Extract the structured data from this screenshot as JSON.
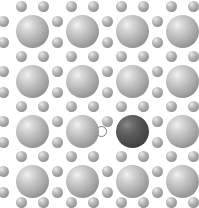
{
  "figure": {
    "width": 199,
    "height": 208,
    "background_color": "#ffffff"
  },
  "legend_colors": {
    "host_atom": "#ababab",
    "dopant_atom": "#4a4a4a",
    "interstitial_atom": "#a2a2a2",
    "vacancy_outline": "#7d7d7d"
  },
  "lattice": {
    "description": "Two-dimensional square lattice of large host spheres with small interstitial spheres at the inter-site positions; one substituted dark atom and one vacancy site.",
    "large_atom_diameter": 33,
    "small_atom_diameter": 11,
    "vacancy_diameter": 11,
    "column_centers": [
      32,
      82,
      132,
      182
    ],
    "row_centers": [
      31,
      81,
      131,
      181
    ]
  },
  "atoms": {
    "large": [
      {
        "id": "L-r1c1",
        "kind": "host",
        "cx": 32,
        "cy": 31,
        "d": 33
      },
      {
        "id": "L-r1c2",
        "kind": "host",
        "cx": 82,
        "cy": 31,
        "d": 33
      },
      {
        "id": "L-r1c3",
        "kind": "host",
        "cx": 132,
        "cy": 31,
        "d": 33
      },
      {
        "id": "L-r1c4",
        "kind": "host",
        "cx": 182,
        "cy": 31,
        "d": 33
      },
      {
        "id": "L-r2c1",
        "kind": "host",
        "cx": 32,
        "cy": 81,
        "d": 33
      },
      {
        "id": "L-r2c2",
        "kind": "host",
        "cx": 82,
        "cy": 81,
        "d": 33
      },
      {
        "id": "L-r2c3",
        "kind": "host",
        "cx": 132,
        "cy": 81,
        "d": 33
      },
      {
        "id": "L-r2c4",
        "kind": "host",
        "cx": 182,
        "cy": 81,
        "d": 33
      },
      {
        "id": "L-r3c1",
        "kind": "host",
        "cx": 32,
        "cy": 131,
        "d": 33
      },
      {
        "id": "L-r3c2",
        "kind": "host",
        "cx": 82,
        "cy": 131,
        "d": 33
      },
      {
        "id": "L-r3c3",
        "kind": "dopant",
        "cx": 132,
        "cy": 131,
        "d": 33
      },
      {
        "id": "L-r3c4",
        "kind": "host",
        "cx": 182,
        "cy": 131,
        "d": 33
      },
      {
        "id": "L-r4c1",
        "kind": "host",
        "cx": 32,
        "cy": 181,
        "d": 33
      },
      {
        "id": "L-r4c2",
        "kind": "host",
        "cx": 82,
        "cy": 181,
        "d": 33
      },
      {
        "id": "L-r4c3",
        "kind": "host",
        "cx": 132,
        "cy": 181,
        "d": 33
      },
      {
        "id": "L-r4c4",
        "kind": "host",
        "cx": 182,
        "cy": 181,
        "d": 33
      }
    ],
    "small": [
      {
        "id": "S-t1a",
        "cx": 21,
        "cy": 6,
        "d": 11
      },
      {
        "id": "S-t1b",
        "cx": 43,
        "cy": 6,
        "d": 11
      },
      {
        "id": "S-t2a",
        "cx": 71,
        "cy": 6,
        "d": 11
      },
      {
        "id": "S-t2b",
        "cx": 93,
        "cy": 6,
        "d": 11
      },
      {
        "id": "S-t3a",
        "cx": 121,
        "cy": 6,
        "d": 11
      },
      {
        "id": "S-t3b",
        "cx": 143,
        "cy": 6,
        "d": 11
      },
      {
        "id": "S-t4a",
        "cx": 171,
        "cy": 6,
        "d": 11
      },
      {
        "id": "S-t4b",
        "cx": 193,
        "cy": 6,
        "d": 11
      },
      {
        "id": "S-a1L",
        "cx": 3,
        "cy": 21,
        "d": 11
      },
      {
        "id": "S-a1R",
        "cx": 3,
        "cy": 42,
        "d": 11
      },
      {
        "id": "S-a2L",
        "cx": 57,
        "cy": 21,
        "d": 11
      },
      {
        "id": "S-a2R",
        "cx": 57,
        "cy": 42,
        "d": 11
      },
      {
        "id": "S-a3L",
        "cx": 107,
        "cy": 21,
        "d": 11
      },
      {
        "id": "S-a3R",
        "cx": 107,
        "cy": 42,
        "d": 11
      },
      {
        "id": "S-a4L",
        "cx": 157,
        "cy": 21,
        "d": 11
      },
      {
        "id": "S-a4R",
        "cx": 157,
        "cy": 42,
        "d": 11
      },
      {
        "id": "S-b1a",
        "cx": 21,
        "cy": 56,
        "d": 11
      },
      {
        "id": "S-b1b",
        "cx": 43,
        "cy": 56,
        "d": 11
      },
      {
        "id": "S-b2a",
        "cx": 71,
        "cy": 56,
        "d": 11
      },
      {
        "id": "S-b2b",
        "cx": 93,
        "cy": 56,
        "d": 11
      },
      {
        "id": "S-b3a",
        "cx": 121,
        "cy": 56,
        "d": 11
      },
      {
        "id": "S-b3b",
        "cx": 143,
        "cy": 56,
        "d": 11
      },
      {
        "id": "S-b4a",
        "cx": 171,
        "cy": 56,
        "d": 11
      },
      {
        "id": "S-b4b",
        "cx": 193,
        "cy": 56,
        "d": 11
      },
      {
        "id": "S-c1L",
        "cx": 3,
        "cy": 71,
        "d": 11
      },
      {
        "id": "S-c1R",
        "cx": 3,
        "cy": 92,
        "d": 11
      },
      {
        "id": "S-c2L",
        "cx": 57,
        "cy": 71,
        "d": 11
      },
      {
        "id": "S-c2R",
        "cx": 57,
        "cy": 92,
        "d": 11
      },
      {
        "id": "S-c3L",
        "cx": 107,
        "cy": 71,
        "d": 11
      },
      {
        "id": "S-c3R",
        "cx": 107,
        "cy": 92,
        "d": 11
      },
      {
        "id": "S-c4L",
        "cx": 157,
        "cy": 71,
        "d": 11
      },
      {
        "id": "S-c4R",
        "cx": 157,
        "cy": 92,
        "d": 11
      },
      {
        "id": "S-d1a",
        "cx": 21,
        "cy": 106,
        "d": 11
      },
      {
        "id": "S-d1b",
        "cx": 43,
        "cy": 106,
        "d": 11
      },
      {
        "id": "S-d2a",
        "cx": 71,
        "cy": 106,
        "d": 11
      },
      {
        "id": "S-d2b",
        "cx": 93,
        "cy": 106,
        "d": 11
      },
      {
        "id": "S-d3a",
        "cx": 121,
        "cy": 106,
        "d": 11
      },
      {
        "id": "S-d3b",
        "cx": 143,
        "cy": 106,
        "d": 11
      },
      {
        "id": "S-d4a",
        "cx": 171,
        "cy": 106,
        "d": 11
      },
      {
        "id": "S-d4b",
        "cx": 193,
        "cy": 106,
        "d": 11
      },
      {
        "id": "S-e1L",
        "cx": 3,
        "cy": 121,
        "d": 11
      },
      {
        "id": "S-e1R",
        "cx": 3,
        "cy": 142,
        "d": 11
      },
      {
        "id": "S-e2L",
        "cx": 57,
        "cy": 121,
        "d": 11
      },
      {
        "id": "S-e2R",
        "cx": 57,
        "cy": 142,
        "d": 11
      },
      {
        "id": "S-e3L",
        "cx": 107,
        "cy": 121,
        "d": 11
      },
      {
        "id": "S-e4L",
        "cx": 157,
        "cy": 121,
        "d": 11
      },
      {
        "id": "S-e4R",
        "cx": 157,
        "cy": 142,
        "d": 11
      },
      {
        "id": "S-f1a",
        "cx": 21,
        "cy": 156,
        "d": 11
      },
      {
        "id": "S-f1b",
        "cx": 43,
        "cy": 156,
        "d": 11
      },
      {
        "id": "S-f2a",
        "cx": 71,
        "cy": 156,
        "d": 11
      },
      {
        "id": "S-f2b",
        "cx": 93,
        "cy": 156,
        "d": 11
      },
      {
        "id": "S-f3a",
        "cx": 121,
        "cy": 156,
        "d": 11
      },
      {
        "id": "S-f3b",
        "cx": 143,
        "cy": 156,
        "d": 11
      },
      {
        "id": "S-f4a",
        "cx": 171,
        "cy": 156,
        "d": 11
      },
      {
        "id": "S-f4b",
        "cx": 193,
        "cy": 156,
        "d": 11
      },
      {
        "id": "S-g1L",
        "cx": 3,
        "cy": 171,
        "d": 11
      },
      {
        "id": "S-g1R",
        "cx": 3,
        "cy": 192,
        "d": 11
      },
      {
        "id": "S-g2L",
        "cx": 57,
        "cy": 171,
        "d": 11
      },
      {
        "id": "S-g2R",
        "cx": 57,
        "cy": 192,
        "d": 11
      },
      {
        "id": "S-g3L",
        "cx": 107,
        "cy": 171,
        "d": 11
      },
      {
        "id": "S-g3R",
        "cx": 107,
        "cy": 192,
        "d": 11
      },
      {
        "id": "S-g4L",
        "cx": 157,
        "cy": 171,
        "d": 11
      },
      {
        "id": "S-g4R",
        "cx": 157,
        "cy": 192,
        "d": 11
      },
      {
        "id": "S-h1a",
        "cx": 21,
        "cy": 202,
        "d": 11
      },
      {
        "id": "S-h1b",
        "cx": 43,
        "cy": 202,
        "d": 11
      },
      {
        "id": "S-h2a",
        "cx": 71,
        "cy": 202,
        "d": 11
      },
      {
        "id": "S-h2b",
        "cx": 93,
        "cy": 202,
        "d": 11
      },
      {
        "id": "S-h3a",
        "cx": 121,
        "cy": 202,
        "d": 11
      },
      {
        "id": "S-h3b",
        "cx": 143,
        "cy": 202,
        "d": 11
      },
      {
        "id": "S-h4a",
        "cx": 171,
        "cy": 202,
        "d": 11
      },
      {
        "id": "S-h4b",
        "cx": 193,
        "cy": 202,
        "d": 11
      }
    ],
    "vacancy": [
      {
        "id": "V-1",
        "cx": 101,
        "cy": 131,
        "d": 11
      }
    ]
  }
}
